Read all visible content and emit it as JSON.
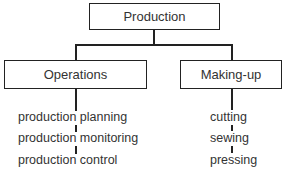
{
  "diagram": {
    "type": "hierarchy",
    "root": {
      "label": "Production"
    },
    "branches": [
      {
        "label": "Operations",
        "items": [
          "production planning",
          "production monitoring",
          "production control"
        ]
      },
      {
        "label": "Making-up",
        "items": [
          "cutting",
          "sewing",
          "pressing"
        ]
      }
    ]
  }
}
